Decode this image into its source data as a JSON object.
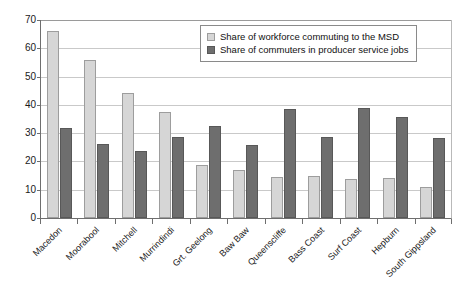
{
  "chart_data": {
    "type": "bar",
    "title": "",
    "subtitle": "",
    "xlabel": "",
    "ylabel": "",
    "ylim": [
      0,
      70
    ],
    "yticks": [
      0,
      10,
      20,
      30,
      40,
      50,
      60,
      70
    ],
    "grid": true,
    "legend_position": "top-right",
    "categories": [
      "Macedon",
      "Moorabool",
      "Mitchell",
      "Murrindindi",
      "Grt. Geelong",
      "Baw Baw",
      "Queenscliffe",
      "Bass Coast",
      "Surf Coast",
      "Hepburn",
      "South Gippsland"
    ],
    "series": [
      {
        "name": "Share of workforce commuting to the MSD",
        "color": "#d6d6d6",
        "values": [
          66,
          56,
          44.2,
          37.5,
          18.8,
          16.8,
          14.6,
          14.8,
          13.8,
          14,
          10.8
        ]
      },
      {
        "name": "Share of commuters in producer service jobs",
        "color": "#6e6e6e",
        "values": [
          32,
          26,
          23.6,
          28.5,
          32.5,
          25.7,
          38.7,
          28.8,
          38.8,
          35.8,
          28.3
        ]
      }
    ]
  },
  "legend": {
    "items": [
      {
        "label": "Share of workforce commuting to the MSD",
        "series": "a"
      },
      {
        "label": "Share of commuters in producer service jobs",
        "series": "b"
      }
    ]
  }
}
